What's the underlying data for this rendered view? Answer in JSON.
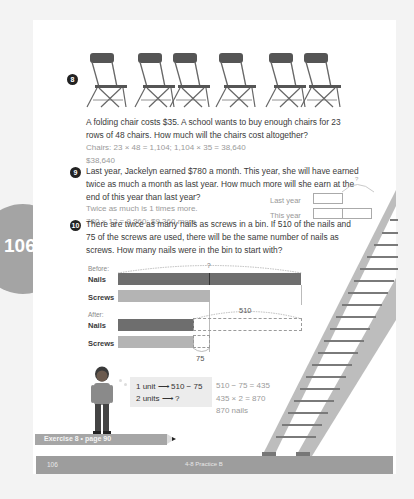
{
  "side_tab": {
    "page_number": "106"
  },
  "problem8": {
    "number": "8",
    "chair_count": 6,
    "question_lines": [
      "A folding chair costs $35. A school wants to buy enough chairs for 23",
      "rows of 48 chairs. How much will the chairs cost altogether?"
    ],
    "answer_lines": [
      "Chairs: 23 × 48 = 1,104;  1,104 × 35 = 38,640",
      "$38,640"
    ]
  },
  "problem9": {
    "number": "9",
    "question_lines": [
      "Last year, Jackelyn earned $780 a month. This year, she will have earned",
      "twice as much a month as last year. How much more will she earn at the",
      "end of this year than last year?"
    ],
    "answer_lines": [
      "Twice as much is 1 times more.",
      "780 × 12 = 9,360;  $9,360 more"
    ],
    "model": {
      "last_year_label": "Last year",
      "this_year_label": "This year",
      "unknown_label": "?"
    }
  },
  "problem10": {
    "number": "10",
    "question_lines": [
      "There are twice as many nails as screws in a bin. If 510 of the nails and",
      "75 of the screws are used, there will be the same number of nails as",
      "screws. How many nails were in the bin to start with?"
    ],
    "diagram": {
      "before_label": "Before:",
      "after_label": "After:",
      "nails_label": "Nails",
      "screws_label": "Screws",
      "total_unknown": "?",
      "used_nails": "510",
      "used_screws": "75"
    },
    "bubble_lines": [
      "1 unit ⟶ 510 − 75",
      "2 units ⟶ ?"
    ],
    "answer_lines": [
      "510 − 75 = 435",
      "435 × 2 = 870",
      "870 nails"
    ]
  },
  "pencil_banner": {
    "label": "Exercise 8 • page 90"
  },
  "footer": {
    "page": "106",
    "title": "4-8 Practice B"
  },
  "colors": {
    "page_bg": "#ffffff",
    "outer_bg": "#f3f3f3",
    "accent_gray": "#a4a4a4",
    "bar_dark": "#6e6e6e",
    "bar_light": "#b4b4b4",
    "answer_text": "#9a9a9a"
  }
}
